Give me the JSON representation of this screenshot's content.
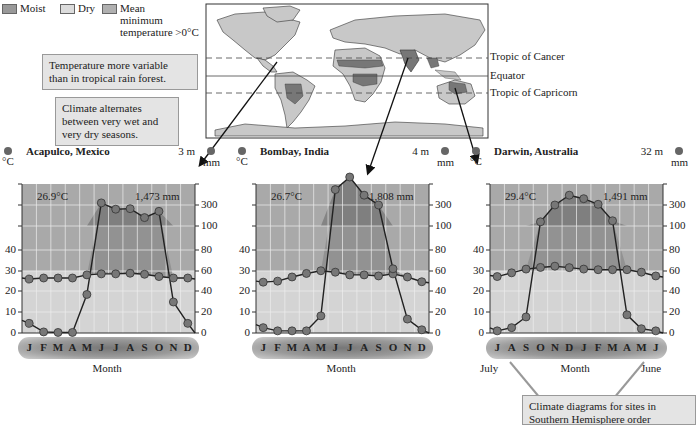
{
  "legend": {
    "moist": {
      "label": "Moist",
      "color": "#999999"
    },
    "dry": {
      "label": "Dry",
      "color": "#d6d6d6"
    },
    "mean_min": {
      "label_lines": [
        "Mean",
        "minimum",
        "temperature >0°C"
      ],
      "color": "#b0b0b0"
    }
  },
  "notes": {
    "temp_variable": [
      "Temperature more variable",
      "than in tropical rain forest."
    ],
    "alternates": [
      "Climate alternates",
      "between very wet and",
      "very dry seasons."
    ],
    "southern": [
      "Climate diagrams for sites in",
      "Southern Hemisphere order"
    ]
  },
  "map": {
    "lines": [
      {
        "label": "Tropic of Cancer"
      },
      {
        "label": "Equator"
      },
      {
        "label": "Tropic of Capricorn"
      }
    ]
  },
  "axis": {
    "left_unit": "°C",
    "right_unit": "mm",
    "left_ticks": [
      "40",
      "30",
      "20",
      "10",
      "0"
    ],
    "right_ticks": [
      "300",
      "100",
      "80",
      "60",
      "40",
      "20",
      "0"
    ],
    "xlabel": "Month"
  },
  "chart_data": [
    {
      "type": "line",
      "title": "Acapulco, Mexico",
      "elevation": "3 m",
      "mean_temp": "26.9°C",
      "annual_precip": "1,473 mm",
      "categories": [
        "J",
        "F",
        "M",
        "A",
        "M",
        "J",
        "J",
        "A",
        "S",
        "O",
        "N",
        "D"
      ],
      "series": [
        {
          "name": "Temperature (°C)",
          "values": [
            26,
            26.5,
            26.5,
            26.5,
            28,
            28.5,
            28.5,
            28.8,
            28.3,
            27.2,
            26.5,
            26.5
          ]
        },
        {
          "name": "Precipitation (mm)",
          "values": [
            9,
            1,
            0.5,
            0.5,
            36,
            330,
            260,
            265,
            180,
            240,
            29,
            9
          ]
        }
      ],
      "xlabel": "Month",
      "ylabel_left": "°C",
      "ylabel_right": "mm"
    },
    {
      "type": "line",
      "title": "Bombay, India",
      "elevation": "4 m",
      "mean_temp": "26.7°C",
      "annual_precip": "1,808 mm",
      "categories": [
        "J",
        "F",
        "M",
        "A",
        "M",
        "J",
        "J",
        "A",
        "S",
        "O",
        "N",
        "D"
      ],
      "series": [
        {
          "name": "Temperature (°C)",
          "values": [
            24.5,
            25,
            27,
            28.7,
            30,
            29.3,
            28,
            28,
            27.5,
            28.5,
            27,
            24.7
          ]
        },
        {
          "name": "Precipitation (mm)",
          "values": [
            5,
            2,
            2,
            2,
            16,
            520,
            700,
            440,
            300,
            60,
            13,
            3
          ]
        }
      ],
      "xlabel": "Month",
      "ylabel_left": "°C",
      "ylabel_right": "mm"
    },
    {
      "type": "line",
      "title": "Darwin, Australia",
      "elevation": "32 m",
      "mean_temp": "29.4°C",
      "annual_precip": "1,491 mm",
      "categories": [
        "J",
        "A",
        "S",
        "O",
        "N",
        "D",
        "J",
        "F",
        "M",
        "A",
        "M",
        "J"
      ],
      "x_start_label": "July",
      "x_end_label": "June",
      "series": [
        {
          "name": "Temperature (°C)",
          "values": [
            27.2,
            29,
            30.8,
            31.6,
            32.2,
            31.5,
            30.8,
            30.5,
            30.5,
            30.5,
            29.3,
            27.5
          ]
        },
        {
          "name": "Precipitation (mm)",
          "values": [
            2,
            5,
            15,
            140,
            300,
            440,
            390,
            310,
            150,
            17,
            4,
            2
          ]
        }
      ],
      "xlabel": "Month",
      "ylabel_left": "°C",
      "ylabel_right": "mm"
    }
  ]
}
